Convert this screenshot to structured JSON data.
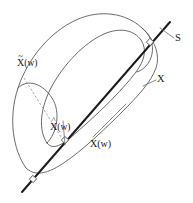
{
  "figure": {
    "kind": "math-diagram",
    "background_color": "#ffffff",
    "curve_color": "#5a5a5a",
    "geodesic_color": "#1c1c1c",
    "leader_color": "#6b6b6b",
    "label_color": "#1a1a1a"
  },
  "labels": {
    "x_tilde": {
      "base": "X",
      "accent": "~",
      "suffix": "(w)"
    },
    "x_hat": {
      "base": "X",
      "accent": "^",
      "suffix": "(w)"
    },
    "x_of_w": {
      "text": "X(w)"
    },
    "manifold": {
      "text": "X"
    },
    "line": {
      "text": "S"
    }
  },
  "markers": {
    "right_angle_count": 3,
    "positions": [
      "top-right",
      "middle",
      "bottom-left"
    ]
  }
}
